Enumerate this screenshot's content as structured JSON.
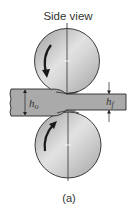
{
  "title": "Side view",
  "caption": "(a)",
  "labels": {
    "entry_thickness": "h",
    "entry_sub": "o",
    "exit_thickness": "h",
    "exit_sub": "f"
  },
  "elements": {
    "top_roll": {
      "rotation": "counterclockwise-left-side-down",
      "icon": "curved-arrow-down"
    },
    "bottom_roll": {
      "rotation": "left-side-up",
      "icon": "curved-arrow-up"
    },
    "strip": "workpiece being rolled from thickness h_o to h_f"
  },
  "colors": {
    "roll_fill": "#c9c9c9",
    "roll_outline": "#2a2a2a",
    "strip_fill": "#aaaaaa",
    "strip_outline": "#2a2a2a",
    "text": "#333333"
  }
}
